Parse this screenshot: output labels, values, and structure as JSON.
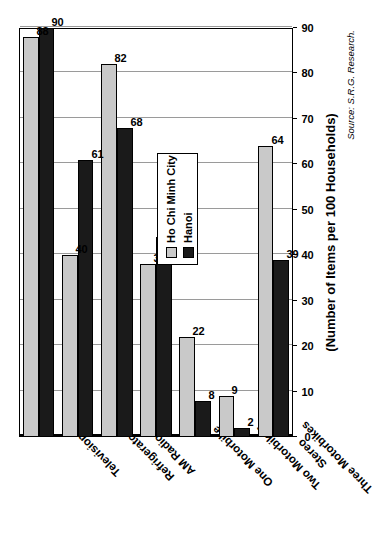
{
  "chart_data": {
    "type": "bar",
    "orientation": "vertical-rotated",
    "title": "",
    "xlabel": "",
    "ylabel": "(Number of Items per 100 Households)",
    "ylim": [
      0,
      90
    ],
    "ytick_step": 10,
    "yticks": [
      "0",
      "10",
      "20",
      "30",
      "40",
      "50",
      "60",
      "70",
      "80",
      "90"
    ],
    "grid": true,
    "legend_position": "inside-upper-right",
    "categories": [
      "Television",
      "Refrigerator",
      "AM Radio",
      "One Motorbike",
      "Two Motorbikes",
      "Three Motorbikes",
      "Stereo"
    ],
    "series": [
      {
        "name": "Ho Chi Minh City",
        "color": "#c9c9c9",
        "values": [
          88,
          40,
          82,
          38,
          22,
          9,
          64
        ]
      },
      {
        "name": "Hanoi",
        "color": "#1a1a1a",
        "values": [
          90,
          61,
          68,
          44,
          8,
          2,
          39
        ]
      }
    ],
    "data_labels": [
      [
        "88",
        "90"
      ],
      [
        "40",
        "61"
      ],
      [
        "82",
        "68"
      ],
      [
        "38",
        "44"
      ],
      [
        "22",
        "8"
      ],
      [
        "9",
        "2"
      ],
      [
        "64",
        "39"
      ]
    ],
    "annotations": {
      "source": "Source: S.R.G. Research."
    }
  },
  "legend": {
    "items": [
      {
        "label": "Ho Chi Minh City",
        "color": "#c9c9c9"
      },
      {
        "label": "Hanoi",
        "color": "#1a1a1a"
      }
    ]
  },
  "footer": {
    "source": "Source: S.R.G. Research."
  },
  "axis": {
    "value_title": "(Number of Items per 100 Households)"
  }
}
